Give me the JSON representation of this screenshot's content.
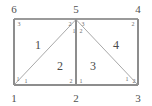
{
  "figure": {
    "type": "finite-element-mesh-diagram",
    "stroke_color": "#8a8a8a",
    "label_color": "#555555",
    "background": "#ffffff"
  },
  "global_nodes": [
    {
      "label": "6",
      "x": 14,
      "y": 9
    },
    {
      "label": "5",
      "x": 76,
      "y": 9
    },
    {
      "label": "4",
      "x": 138,
      "y": 9
    },
    {
      "label": "1",
      "x": 14,
      "y": 98
    },
    {
      "label": "2",
      "x": 76,
      "y": 98
    },
    {
      "label": "3",
      "x": 138,
      "y": 98
    }
  ],
  "elements": [
    {
      "label": "1",
      "x": 38,
      "y": 45
    },
    {
      "label": "2",
      "x": 60,
      "y": 66
    },
    {
      "label": "3",
      "x": 93,
      "y": 66
    },
    {
      "label": "4",
      "x": 116,
      "y": 45
    }
  ],
  "local_nodes": [
    {
      "label": "3",
      "x": 19,
      "y": 24
    },
    {
      "label": "2",
      "x": 70,
      "y": 24
    },
    {
      "label": "3",
      "x": 83,
      "y": 24
    },
    {
      "label": "2",
      "x": 133,
      "y": 24
    },
    {
      "label": "1",
      "x": 74,
      "y": 31
    },
    {
      "label": "2",
      "x": 81,
      "y": 31
    },
    {
      "label": "1",
      "x": 18,
      "y": 79
    },
    {
      "label": "1",
      "x": 26,
      "y": 81
    },
    {
      "label": "2",
      "x": 71,
      "y": 81
    },
    {
      "label": "1",
      "x": 81,
      "y": 81
    },
    {
      "label": "1",
      "x": 127,
      "y": 79
    },
    {
      "label": "2",
      "x": 134,
      "y": 81
    }
  ],
  "geometry": {
    "rect": {
      "x1": 14,
      "y1": 19,
      "x2": 138,
      "y2": 85
    },
    "apex": {
      "x": 76,
      "y": 19
    },
    "edges": [
      {
        "name": "top-edge",
        "x1": 14,
        "y1": 19,
        "x2": 138,
        "y2": 19
      },
      {
        "name": "bottom-edge",
        "x1": 14,
        "y1": 85,
        "x2": 138,
        "y2": 85
      },
      {
        "name": "left-edge",
        "x1": 14,
        "y1": 19,
        "x2": 14,
        "y2": 85
      },
      {
        "name": "right-edge",
        "x1": 138,
        "y1": 19,
        "x2": 138,
        "y2": 85
      },
      {
        "name": "diagonal-left",
        "x1": 14,
        "y1": 85,
        "x2": 76,
        "y2": 19
      },
      {
        "name": "median-vertical",
        "x1": 76,
        "y1": 19,
        "x2": 76,
        "y2": 85
      },
      {
        "name": "diagonal-right",
        "x1": 76,
        "y1": 19,
        "x2": 138,
        "y2": 85
      }
    ]
  }
}
